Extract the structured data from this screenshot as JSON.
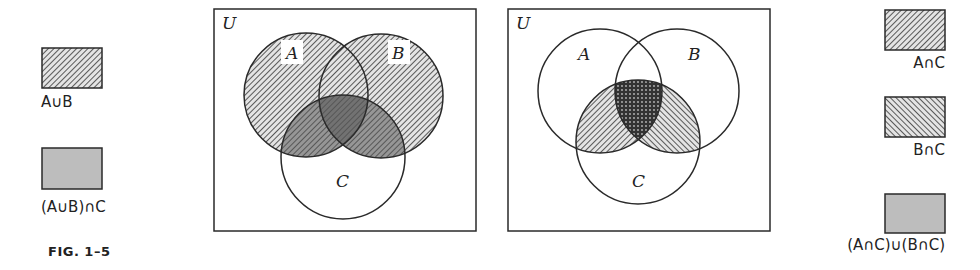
{
  "figure": {
    "caption": "FIG. 1–5",
    "colors": {
      "ink": "#2a2a2a",
      "shade_gray": "#b8b8b8",
      "background": "#ffffff"
    }
  },
  "left_legend": {
    "items": [
      {
        "label": "A∪B",
        "pattern": "hatch-forward"
      },
      {
        "label": "(A∪B)∩C",
        "pattern": "gray-fill"
      }
    ]
  },
  "right_legend": {
    "items": [
      {
        "label": "A∩C",
        "pattern": "hatch-forward"
      },
      {
        "label": "B∩C",
        "pattern": "hatch-backward"
      },
      {
        "label": "(A∩C)∪(B∩C)",
        "pattern": "gray-fill"
      }
    ]
  },
  "diagrams": [
    {
      "universe_label": "U",
      "sets": [
        {
          "label": "A"
        },
        {
          "label": "B"
        },
        {
          "label": "C"
        }
      ],
      "shaded": [
        "A∪B",
        "(A∪B)∩C"
      ]
    },
    {
      "universe_label": "U",
      "sets": [
        {
          "label": "A"
        },
        {
          "label": "B"
        },
        {
          "label": "C"
        }
      ],
      "shaded": [
        "A∩C",
        "B∩C",
        "(A∩C)∪(B∩C)"
      ]
    }
  ]
}
